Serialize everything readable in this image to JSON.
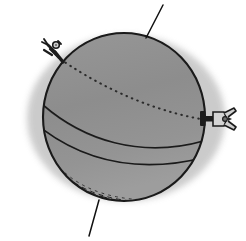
{
  "figure": {
    "canvas": {
      "width": 246,
      "height": 241
    },
    "caption": "",
    "style": "line-art / engraving"
  },
  "colors": {
    "background": "#ffffff",
    "halo_shadow": "#c9c9c9",
    "sphere_fill": "#8e8e8e",
    "sphere_fill_lower": "#9a9a9a",
    "outline": "#1a1a1a",
    "seam_line": "#1a1a1a",
    "hidden_seam": "#2b2b2b",
    "hatch": "#141414",
    "fitting_metal_dark": "#1c1c1c",
    "fitting_metal_light": "#d0d0d0",
    "leader_line": "#101010"
  },
  "geometry": {
    "halo": {
      "cx": 124,
      "cy": 117,
      "rx": 100,
      "ry": 84
    },
    "sphere": {
      "cx": 124,
      "cy": 117,
      "rx": 81,
      "ry": 84
    },
    "sphere_top_y": 33,
    "sphere_bottom_y": 201,
    "sphere_left_x": 43,
    "sphere_right_x": 205
  },
  "parts": [
    {
      "id": "sphere-body",
      "label": "Sphere body",
      "kind": "filled-circle"
    },
    {
      "id": "halo",
      "label": "Cast shadow halo",
      "kind": "soft-ellipse"
    },
    {
      "id": "seam-upper",
      "label": "Upper visible seam",
      "kind": "solid-curve"
    },
    {
      "id": "seam-lower",
      "label": "Lower visible seam",
      "kind": "solid-curve"
    },
    {
      "id": "seam-hidden",
      "label": "Hidden seam (far side)",
      "kind": "dotted-curve"
    },
    {
      "id": "shading-hatch",
      "label": "Bottom shading hatch",
      "kind": "hatch-lines"
    },
    {
      "id": "fitting-top-left",
      "label": "Upper-left clip fitting",
      "kind": "metal-fitting"
    },
    {
      "id": "fitting-right-valve",
      "label": "Right-side valve with clamp",
      "kind": "metal-valve"
    },
    {
      "id": "leader-top",
      "label": "Top leader line",
      "kind": "leader"
    },
    {
      "id": "leader-bottom",
      "label": "Bottom leader line",
      "kind": "leader"
    }
  ],
  "leaders": {
    "top": {
      "from_x": 163,
      "from_y": 5,
      "to_x": 146,
      "to_y": 38,
      "label": ""
    },
    "bottom": {
      "from_x": 89,
      "from_y": 236,
      "to_x": 99,
      "to_y": 200,
      "label": ""
    }
  },
  "annotations": {
    "top_label": "",
    "bottom_label": "",
    "left_fitting_label": "",
    "right_valve_label": ""
  }
}
